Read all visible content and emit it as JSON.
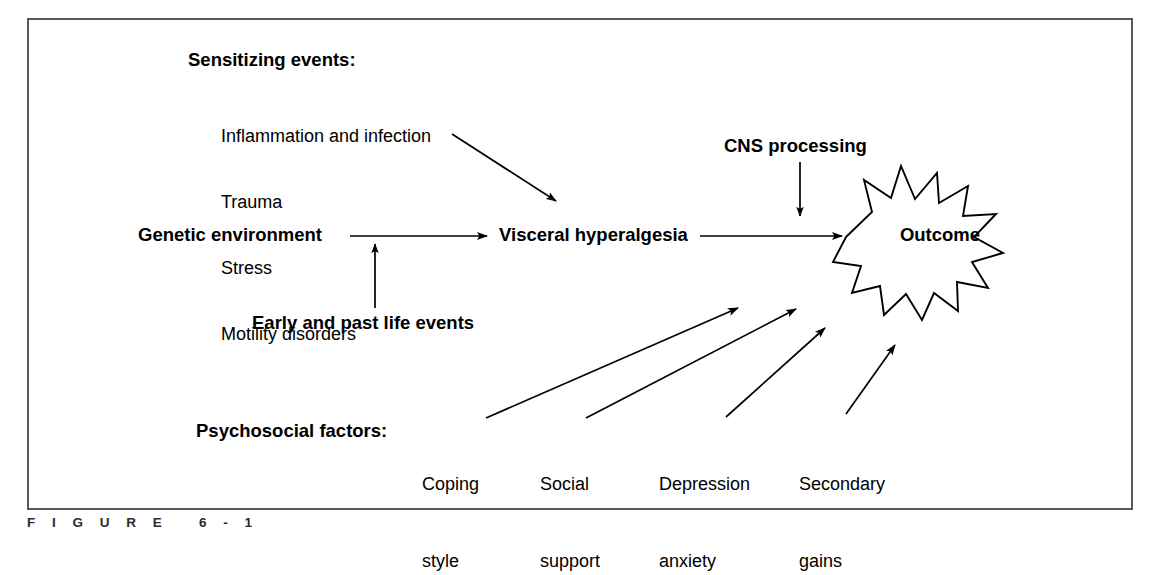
{
  "figure": {
    "caption": "F I G U R E   6 - 1",
    "frame_color": "#5a5a5a",
    "ink_color": "#000000",
    "background": "#ffffff"
  },
  "diagram": {
    "sensitizing": {
      "title": "Sensitizing events:",
      "items": [
        "Inflammation and infection",
        "Trauma",
        "Stress",
        "Motility disorders"
      ]
    },
    "nodes": {
      "genetic_environment": "Genetic environment",
      "visceral_hyperalgesia": "Visceral hyperalgesia",
      "cns_processing": "CNS processing",
      "early_past_life_events": "Early and past life events",
      "outcome": "Outcome"
    },
    "psychosocial": {
      "title": "Psychosocial factors:",
      "factors": [
        {
          "line1": "Coping",
          "line2": "style"
        },
        {
          "line1": "Social",
          "line2": "support"
        },
        {
          "line1": "Depression",
          "line2": "anxiety"
        },
        {
          "line1": "Secondary",
          "line2": "gains"
        }
      ]
    },
    "arrows": [
      {
        "name": "sensitizing-to-visceral",
        "from": "Sensitizing events",
        "to": "Visceral hyperalgesia"
      },
      {
        "name": "genetic-to-visceral",
        "from": "Genetic environment",
        "to": "Visceral hyperalgesia"
      },
      {
        "name": "early-life-to-genetic-link",
        "from": "Early and past life events",
        "to": "Genetic environment"
      },
      {
        "name": "cns-to-outcome-path",
        "from": "CNS processing",
        "to": "Visceral hyperalgesia to Outcome path"
      },
      {
        "name": "visceral-to-outcome",
        "from": "Visceral hyperalgesia",
        "to": "Outcome"
      },
      {
        "name": "coping-style-to-outcome",
        "from": "Coping style",
        "to": "Outcome"
      },
      {
        "name": "social-support-to-outcome",
        "from": "Social support",
        "to": "Outcome"
      },
      {
        "name": "depression-anxiety-to-outcome",
        "from": "Depression anxiety",
        "to": "Outcome"
      },
      {
        "name": "secondary-gains-to-outcome",
        "from": "Secondary gains",
        "to": "Outcome"
      }
    ]
  }
}
